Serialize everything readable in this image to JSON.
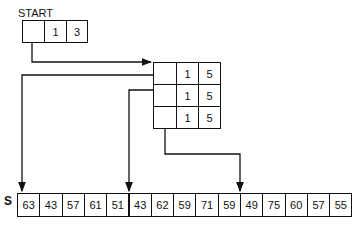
{
  "start": {
    "label": "START",
    "cells": [
      "",
      "1",
      "3"
    ]
  },
  "table": {
    "rows": [
      [
        "",
        "1",
        "5"
      ],
      [
        "",
        "1",
        "5"
      ],
      [
        "",
        "1",
        "5"
      ]
    ]
  },
  "array": {
    "label": "S",
    "values": [
      "63",
      "43",
      "57",
      "61",
      "51",
      "43",
      "62",
      "59",
      "71",
      "59",
      "49",
      "75",
      "60",
      "57",
      "55"
    ]
  },
  "colors": {
    "ink": "#111111",
    "background": "#ffffff"
  }
}
